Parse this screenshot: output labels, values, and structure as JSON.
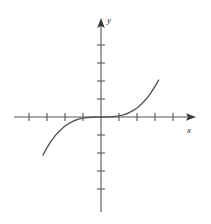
{
  "figure": {
    "kind": "cartesian-function-plot",
    "background_color": "#ffffff",
    "ink_color": "#555555",
    "label_color": "#2b2b2b"
  },
  "axes": {
    "x_axis_label": "x",
    "y_axis_label": "y",
    "origin_px": [
      101,
      117
    ],
    "tick_spacing_px": 18,
    "tick_half_length_px": 4,
    "x_ticks_left_count": 4,
    "x_ticks_right_count": 4,
    "y_ticks_up_count": 4,
    "y_ticks_down_count": 4,
    "x_axis_start_px": 14,
    "x_axis_end_px": 196,
    "y_axis_top_px": 18,
    "y_axis_bottom_px": 212,
    "arrow_x_positive": true,
    "arrow_y_positive": true,
    "tick_labels_shown": false,
    "gridlines_shown": false
  },
  "chart_data": {
    "type": "line",
    "title": "",
    "subtitle": "",
    "xlabel": "x",
    "ylabel": "y",
    "xlim": [
      -4.8,
      5.3
    ],
    "ylim": [
      -5.5,
      5.5
    ],
    "grid": false,
    "legend": false,
    "legend_position": "none",
    "annotations": [],
    "series": [
      {
        "name": "y = x^3",
        "equation": "y = x^3",
        "color": "#555555",
        "line_width_px": 1.4,
        "x": [
          -3.22,
          -3.0,
          -2.75,
          -2.5,
          -2.25,
          -2.0,
          -1.75,
          -1.5,
          -1.25,
          -1.0,
          -0.75,
          -0.5,
          -0.25,
          0.0,
          0.25,
          0.5,
          0.75,
          1.0,
          1.25,
          1.5,
          1.75,
          2.0,
          2.25,
          2.5,
          2.75,
          3.0,
          3.2
        ],
        "y": [
          -2.11,
          -1.7,
          -1.31,
          -0.98,
          -0.72,
          -0.5,
          -0.34,
          -0.21,
          -0.12,
          -0.06,
          -0.03,
          -0.01,
          0.0,
          0.0,
          0.0,
          0.01,
          0.03,
          0.06,
          0.12,
          0.21,
          0.34,
          0.5,
          0.72,
          0.98,
          1.31,
          1.7,
          2.05
        ],
        "y_scale_note": "plotted as y = x^3 / 13.5 so the visible branch fits the 4-tick vertical range"
      }
    ]
  }
}
